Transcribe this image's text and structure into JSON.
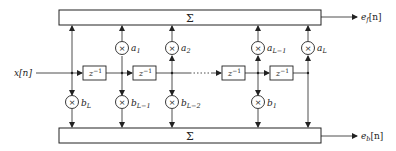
{
  "diagram": {
    "input": {
      "label": "x[n]"
    },
    "sum_top": {
      "label": "Σ"
    },
    "sum_bottom": {
      "label": "Σ"
    },
    "outputs": {
      "forward": {
        "label": "e",
        "sub": "f",
        "arg": "[n]"
      },
      "backward": {
        "label": "e",
        "sub": "b",
        "arg": "[n]"
      }
    },
    "delays": [
      {
        "label": "z",
        "sup": "−1"
      },
      {
        "label": "z",
        "sup": "−1"
      },
      {
        "label": "z",
        "sup": "−1"
      },
      {
        "label": "z",
        "sup": "−1"
      }
    ],
    "forward_coeffs": [
      {
        "label": "a",
        "sub": "1"
      },
      {
        "label": "a",
        "sub": "2"
      },
      {
        "label": "a",
        "sub": "L−1"
      },
      {
        "label": "a",
        "sub": "L"
      }
    ],
    "backward_coeffs": [
      {
        "label": "b",
        "sub": "L"
      },
      {
        "label": "b",
        "sub": "L−1"
      },
      {
        "label": "b",
        "sub": "L−2"
      },
      {
        "label": "b",
        "sub": "1"
      }
    ],
    "multiplier_symbol": "×",
    "colors": {
      "stroke": "#222222",
      "background": "#ffffff"
    }
  }
}
